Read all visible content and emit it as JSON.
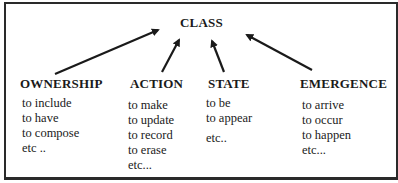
{
  "diagram": {
    "root": {
      "label": "CLASS"
    },
    "categories": [
      {
        "label": "OWNERSHIP",
        "items": [
          "to include",
          "to have",
          "to compose",
          "etc .."
        ]
      },
      {
        "label": "ACTION",
        "items": [
          "to make",
          "to update",
          "to record",
          "to erase",
          "etc..."
        ]
      },
      {
        "label": "STATE",
        "items": [
          "to be",
          "to appear",
          "etc.."
        ]
      },
      {
        "label": "EMERGENCE",
        "items": [
          "to arrive",
          "to occur",
          "to happen",
          "etc..."
        ]
      }
    ],
    "edges": [
      {
        "from": "OWNERSHIP",
        "to": "CLASS"
      },
      {
        "from": "ACTION",
        "to": "CLASS"
      },
      {
        "from": "STATE",
        "to": "CLASS"
      },
      {
        "from": "EMERGENCE",
        "to": "CLASS"
      }
    ],
    "colors": {
      "stroke": "#1a1a1a",
      "background": "#ffffff"
    }
  }
}
